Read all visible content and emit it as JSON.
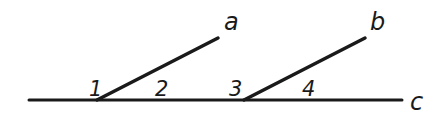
{
  "diagram": {
    "type": "geometry-transversal",
    "stroke_color": "#1a1a1a",
    "background": "#ffffff",
    "lines": [
      {
        "id": "c",
        "label": "c",
        "x1": 29,
        "y1": 100,
        "x2": 402,
        "y2": 100,
        "label_x": 410,
        "label_y": 110
      },
      {
        "id": "a",
        "label": "a",
        "x1": 97,
        "y1": 100,
        "x2": 218,
        "y2": 38,
        "label_x": 224,
        "label_y": 30
      },
      {
        "id": "b",
        "label": "b",
        "x1": 244,
        "y1": 100,
        "x2": 365,
        "y2": 38,
        "label_x": 370,
        "label_y": 30
      }
    ],
    "angles": [
      {
        "label": "1",
        "x": 89,
        "y": 96
      },
      {
        "label": "2",
        "x": 155,
        "y": 96
      },
      {
        "label": "3",
        "x": 229,
        "y": 96
      },
      {
        "label": "4",
        "x": 302,
        "y": 96
      }
    ]
  }
}
